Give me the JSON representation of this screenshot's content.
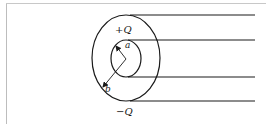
{
  "figure": {
    "labels": {
      "outer_charge": "+Q",
      "inner_radius": "a",
      "outer_radius": "b",
      "bottom_charge": "−Q"
    },
    "colors": {
      "stroke": "#1a1a1a",
      "background": "#ffffff",
      "frame": "#c0c0c0"
    }
  }
}
